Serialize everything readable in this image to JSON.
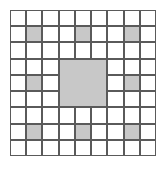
{
  "figure": {
    "title": "",
    "type": "grid-pattern",
    "width": 167,
    "height": 171
  },
  "chart_data": {
    "type": "heatmap",
    "title": "",
    "subtitle": "",
    "xlabel": "",
    "ylabel": "",
    "rows": 9,
    "cols": 9,
    "grid": true,
    "legend": "none",
    "categories": [
      "0",
      "1",
      "2",
      "3",
      "4",
      "5",
      "6",
      "7",
      "8"
    ],
    "values": [
      [
        0,
        0,
        0,
        0,
        0,
        0,
        0,
        0,
        0
      ],
      [
        0,
        1,
        0,
        0,
        1,
        0,
        0,
        1,
        0
      ],
      [
        0,
        0,
        0,
        0,
        0,
        0,
        0,
        0,
        0
      ],
      [
        0,
        0,
        0,
        1,
        1,
        1,
        0,
        0,
        0
      ],
      [
        0,
        1,
        0,
        1,
        1,
        1,
        0,
        1,
        0
      ],
      [
        0,
        0,
        0,
        1,
        1,
        1,
        0,
        0,
        0
      ],
      [
        0,
        0,
        0,
        0,
        0,
        0,
        0,
        0,
        0
      ],
      [
        0,
        1,
        0,
        0,
        1,
        0,
        0,
        1,
        0
      ],
      [
        0,
        0,
        0,
        0,
        0,
        0,
        0,
        0,
        0
      ]
    ],
    "shaded_single_cells": [
      {
        "row": 1,
        "col": 1
      },
      {
        "row": 1,
        "col": 4
      },
      {
        "row": 1,
        "col": 7
      },
      {
        "row": 4,
        "col": 1
      },
      {
        "row": 4,
        "col": 7
      },
      {
        "row": 7,
        "col": 1
      },
      {
        "row": 7,
        "col": 4
      },
      {
        "row": 7,
        "col": 7
      }
    ],
    "merged_blocks": [
      {
        "row": 3,
        "col": 3,
        "row_span": 3,
        "col_span": 3,
        "label": "center-block"
      }
    ],
    "shaded_count": 17,
    "unshaded_count": 64,
    "colors": {
      "shaded_fill": "#c8c8c8",
      "unshaded_fill": "#ffffff",
      "grid_line": "#5a5a5a",
      "background": "#ffffff"
    },
    "geometry": {
      "origin_x": 10,
      "origin_y": 10,
      "cell_size": 16.22,
      "grid_width": 146,
      "grid_height": 146
    }
  }
}
